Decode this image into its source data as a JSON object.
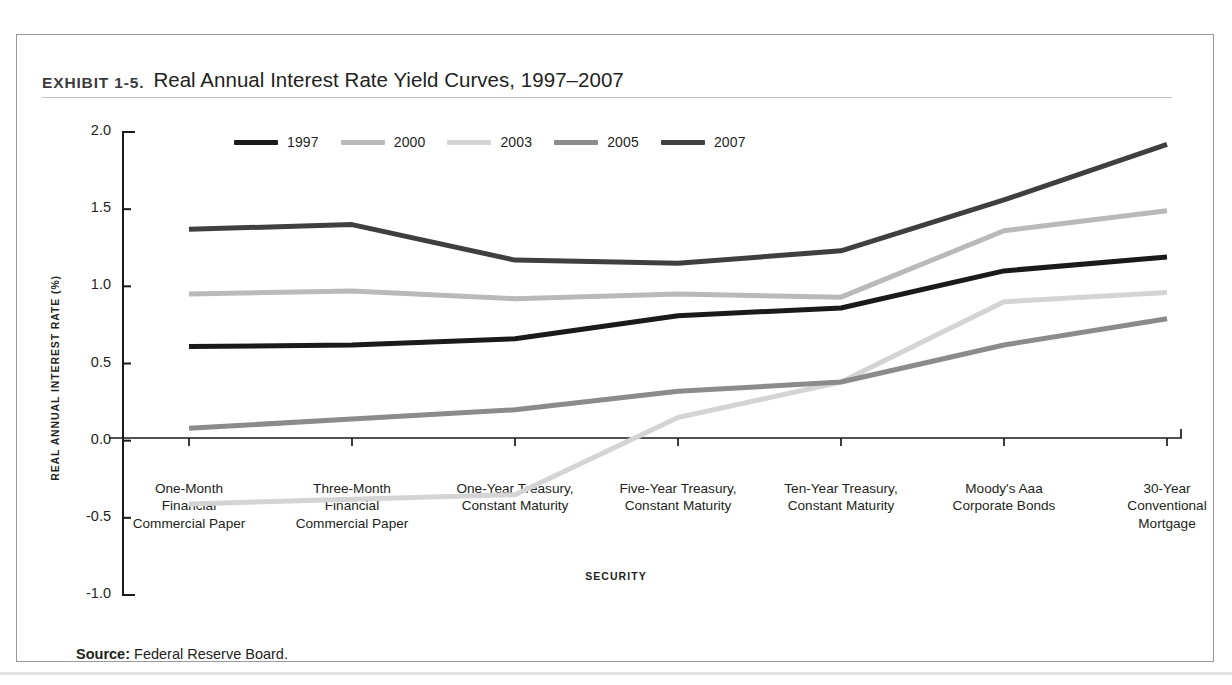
{
  "exhibit": {
    "kicker": "Exhibit 1-5.",
    "title": "Real Annual Interest Rate Yield Curves, 1997–2007",
    "source_label": "Source:",
    "source_text": "Federal Reserve Board."
  },
  "colors": {
    "1997": "#1a1a1a",
    "2000": "#b9b9b9",
    "2003": "#d4d4d4",
    "2005": "#8b8b8b",
    "2007": "#3f3f3f",
    "axis": "#1a1a1a",
    "frame": "#9a9a9a",
    "rule": "#bdbdbd"
  },
  "chart_data": {
    "type": "line",
    "title": "Real Annual Interest Rate Yield Curves, 1997–2007",
    "xlabel": "SECURITY",
    "ylabel": "REAL ANNUAL INTEREST RATE (%)",
    "ylim": [
      -1.0,
      2.0
    ],
    "ytick_labels": [
      "2.0",
      "1.5",
      "1.0",
      "0.5",
      "0.0",
      "-0.5",
      "-1.0"
    ],
    "ytick_values": [
      2.0,
      1.5,
      1.0,
      0.5,
      0.0,
      -0.5,
      -1.0
    ],
    "grid": false,
    "legend_position": "top-left-inside",
    "categories": [
      "One-Month Financial Commercial Paper",
      "Three-Month Financial Commercial Paper",
      "One-Year Treasury, Constant Maturity",
      "Five-Year Treasury, Constant Maturity",
      "Ten-Year Treasury, Constant Maturity",
      "Moody's Aaa Corporate Bonds",
      "30-Year Conventional Mortgage"
    ],
    "category_lines": [
      [
        "One-Month",
        "Financial",
        "Commercial Paper"
      ],
      [
        "Three-Month",
        "Financial",
        "Commercial Paper"
      ],
      [
        "One-Year Treasury,",
        "Constant Maturity"
      ],
      [
        "Five-Year Treasury,",
        "Constant Maturity"
      ],
      [
        "Ten-Year Treasury,",
        "Constant Maturity"
      ],
      [
        "Moody's Aaa",
        "Corporate Bonds"
      ],
      [
        "30-Year",
        "Conventional",
        "Mortgage"
      ]
    ],
    "series": [
      {
        "name": "1997",
        "color": "#1a1a1a",
        "values": [
          0.61,
          0.62,
          0.66,
          0.81,
          0.86,
          1.1,
          1.19
        ]
      },
      {
        "name": "2000",
        "color": "#b9b9b9",
        "values": [
          0.95,
          0.97,
          0.92,
          0.95,
          0.93,
          1.36,
          1.49
        ]
      },
      {
        "name": "2003",
        "color": "#d4d4d4",
        "values": [
          -0.41,
          -0.38,
          -0.35,
          0.15,
          0.38,
          0.9,
          0.96
        ]
      },
      {
        "name": "2005",
        "color": "#8b8b8b",
        "values": [
          0.08,
          0.14,
          0.2,
          0.32,
          0.38,
          0.62,
          0.79
        ]
      },
      {
        "name": "2007",
        "color": "#3f3f3f",
        "values": [
          1.37,
          1.4,
          1.17,
          1.15,
          1.23,
          1.56,
          1.92
        ]
      }
    ]
  },
  "legend": {
    "items": [
      {
        "label": "1997",
        "color": "#1a1a1a"
      },
      {
        "label": "2000",
        "color": "#b9b9b9"
      },
      {
        "label": "2003",
        "color": "#d4d4d4"
      },
      {
        "label": "2005",
        "color": "#8b8b8b"
      },
      {
        "label": "2007",
        "color": "#3f3f3f"
      }
    ]
  }
}
